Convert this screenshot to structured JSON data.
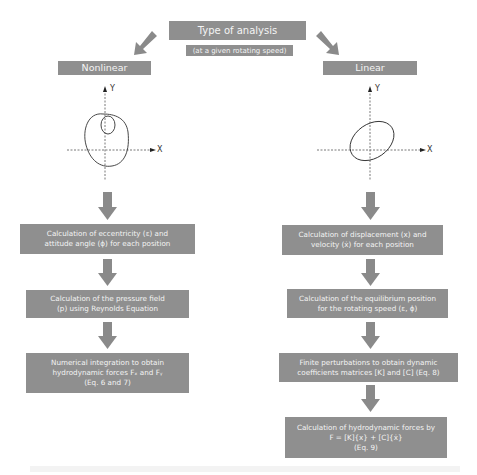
{
  "top": {
    "title": "Type of analysis",
    "subtitle": "(at a given rotating speed)"
  },
  "branches": {
    "left": {
      "label": "Nonlinear",
      "plot": {
        "x_axis": "X",
        "y_axis": "Y",
        "orbit": "nonlinear orbit with inner loop"
      },
      "steps": [
        {
          "lines": [
            "Calculation of eccentricity (ε) and",
            "attitude angle (ϕ) for each position"
          ]
        },
        {
          "lines": [
            "Calculation of the pressure field",
            "(p) using Reynolds Equation"
          ]
        },
        {
          "lines": [
            "Numerical integration to obtain",
            "hydrodynamic forces Fₓ and Fᵧ",
            "(Eq. 6 and 7)"
          ]
        }
      ]
    },
    "right": {
      "label": "Linear",
      "plot": {
        "x_axis": "X",
        "y_axis": "Y",
        "orbit": "elliptical orbit"
      },
      "steps": [
        {
          "lines": [
            "Calculation of displacement (x) and",
            "velocity (ẋ) for each position"
          ]
        },
        {
          "lines": [
            "Calculation of the equilibrium position",
            "for the rotating speed (ε, ϕ)"
          ]
        },
        {
          "lines": [
            "Finite perturbations to obtain dynamic",
            "coefficients matrices [K] and [C] (Eq. 8)"
          ]
        },
        {
          "lines": [
            "Calculation of hydrodynamic forces by",
            "F = [K]{x} + [C]{ẋ}",
            "(Eq. 9)"
          ]
        }
      ]
    }
  },
  "colors": {
    "box_fill": "#8f8f8f",
    "box_text": "#f4f4f4",
    "arrow": "#8a8a8a",
    "axis": "#555555",
    "orbit": "#333333"
  }
}
